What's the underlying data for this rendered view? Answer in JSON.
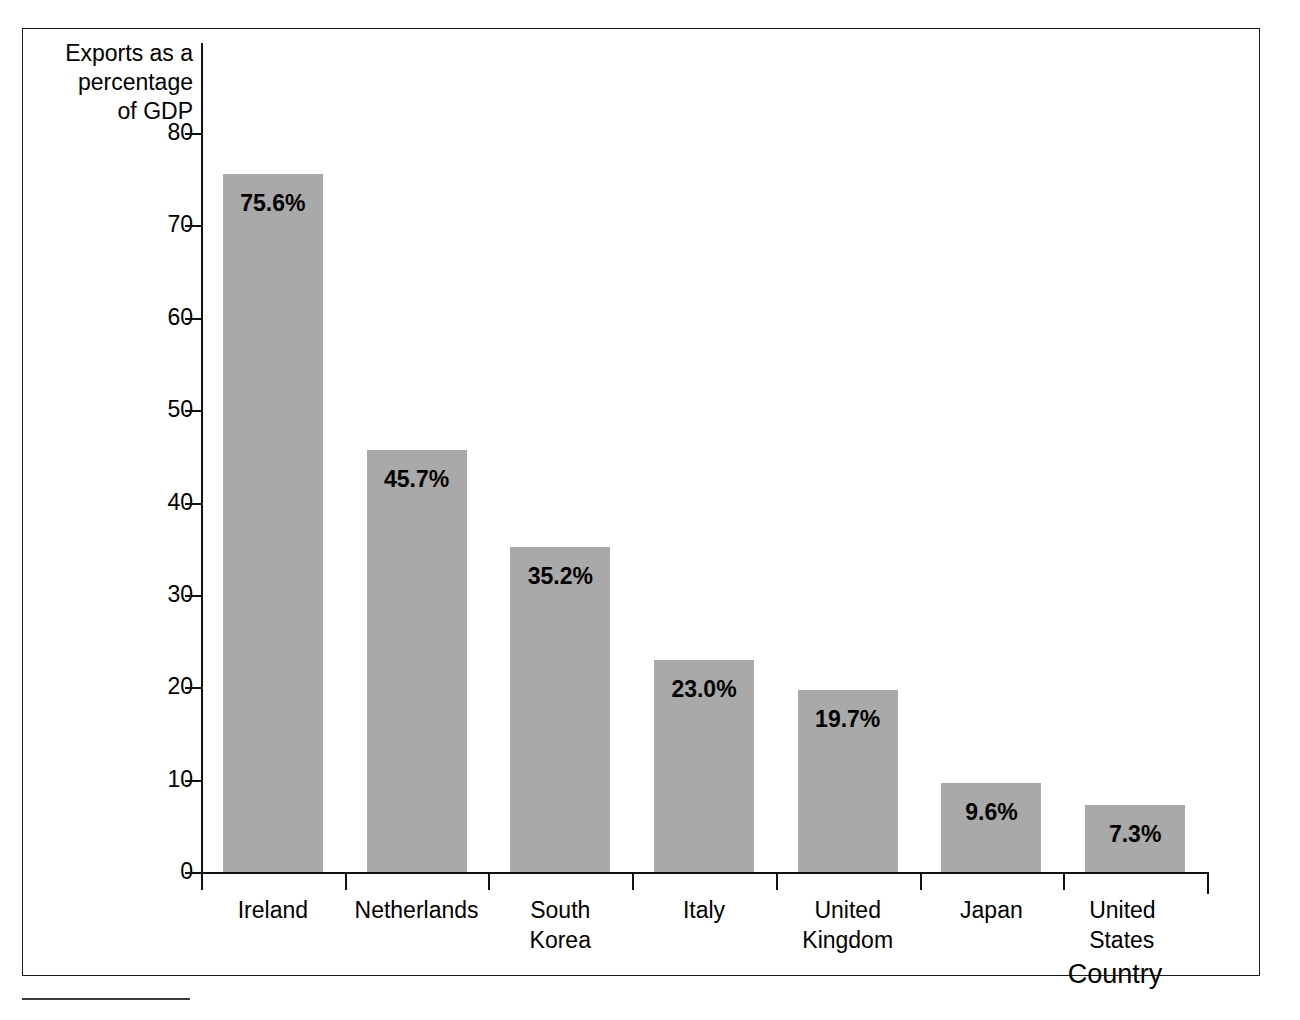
{
  "figure": {
    "y_axis_title": "Exports as a\npercentage\nof GDP",
    "x_axis_title": "Country"
  },
  "chart_data": {
    "type": "bar",
    "title": "",
    "xlabel": "Country",
    "ylabel": "Exports as a percentage of GDP",
    "ylim": [
      0,
      80
    ],
    "yticks": [
      0,
      10,
      20,
      30,
      40,
      50,
      60,
      70,
      80
    ],
    "ytick_labels": [
      "0",
      "10",
      "20",
      "30",
      "40",
      "50",
      "60",
      "70",
      "80"
    ],
    "grid": false,
    "legend": false,
    "bar_color": "#a9a9a9",
    "categories": [
      "Ireland",
      "Netherlands",
      "South\nKorea",
      "Italy",
      "United\nKingdom",
      "Japan",
      "United\nStates"
    ],
    "values": [
      75.6,
      45.7,
      35.2,
      23.0,
      19.7,
      9.6,
      7.3
    ],
    "data_labels": [
      "75.6%",
      "45.7%",
      "35.2%",
      "23.0%",
      "19.7%",
      "9.6%",
      "7.3%"
    ]
  }
}
